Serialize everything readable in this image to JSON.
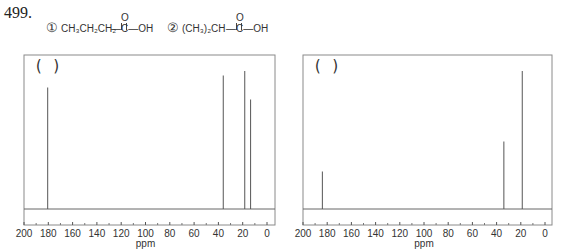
{
  "question": {
    "number": "499.",
    "compounds": [
      {
        "index": "①",
        "label": "CH3CH2CH2—C(=O)—OH",
        "chain": "CH₃CH₂CH₂",
        "group": "—C—OH",
        "carbonyl_o": "O"
      },
      {
        "index": "②",
        "label": "(CH3)2CH—C(=O)—OH",
        "chain": "(CH₃)₂CH",
        "group": "—C—OH",
        "carbonyl_o": "O"
      }
    ]
  },
  "chart_data": [
    {
      "type": "line",
      "title": "",
      "annotation": "(   )",
      "xlabel": "ppm",
      "ylabel": "",
      "xlim": [
        200,
        -6
      ],
      "xticks": [
        200,
        180,
        160,
        140,
        120,
        100,
        80,
        60,
        40,
        20,
        0
      ],
      "grid": false,
      "peaks": [
        {
          "ppm": 180.5,
          "relative_height": 0.81
        },
        {
          "ppm": 36.0,
          "relative_height": 0.89
        },
        {
          "ppm": 18.3,
          "relative_height": 0.92
        },
        {
          "ppm": 13.5,
          "relative_height": 0.73
        }
      ]
    },
    {
      "type": "line",
      "title": "",
      "annotation": "(   )",
      "xlabel": "ppm",
      "ylabel": "",
      "xlim": [
        200,
        -6
      ],
      "xticks": [
        200,
        180,
        160,
        140,
        120,
        100,
        80,
        60,
        40,
        20,
        0
      ],
      "grid": false,
      "peaks": [
        {
          "ppm": 184.0,
          "relative_height": 0.25
        },
        {
          "ppm": 34.0,
          "relative_height": 0.45
        },
        {
          "ppm": 18.8,
          "relative_height": 0.92
        }
      ]
    }
  ],
  "colors": {
    "frame": "#8a8a8a",
    "peak": "#555555",
    "text": "#333333"
  }
}
